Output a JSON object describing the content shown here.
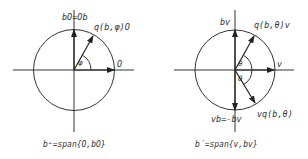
{
  "colors": {
    "stroke": "#333333",
    "background": "#ffffff"
  },
  "left_diagram": {
    "center": [
      74,
      70
    ],
    "radius": 40.5,
    "labels": {
      "vertical_vector": "bO=Ob",
      "rotated_vector": "q(b,φ)O",
      "horizontal_vector": "O",
      "angle": "φ"
    },
    "caption": "b⁺=span{O,bO}"
  },
  "right_diagram": {
    "center": [
      235,
      70
    ],
    "radius": 40,
    "labels": {
      "up_vector": "bv",
      "rotated_up_vector": "q(b,θ)v",
      "horizontal_vector": "v",
      "angle_upper": "θ",
      "angle_lower": "θ",
      "rotated_down_vector": "vq(b,θ)",
      "down_vector": "vb=-bv"
    },
    "caption": "b′=span{v,bv}"
  }
}
